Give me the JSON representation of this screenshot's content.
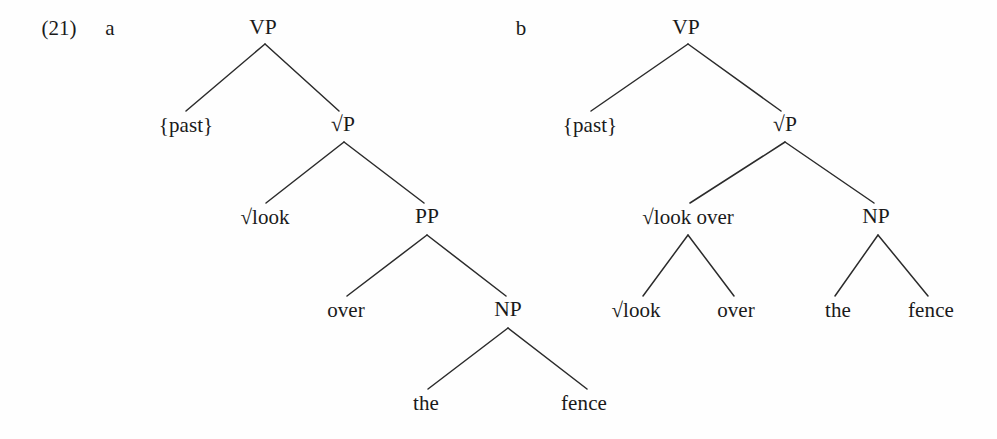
{
  "example": {
    "number": "(21)",
    "sub_labels": {
      "a": "a",
      "b": "b"
    }
  },
  "labels": {
    "vp": "VP",
    "root_p": "√P",
    "pp": "PP",
    "np": "NP",
    "past": "{past}",
    "root_look": "√look",
    "root_look_over": "√look over",
    "over": "over",
    "the": "the",
    "fence": "fence"
  },
  "tree_a": {
    "caption": "a",
    "root": {
      "label": "VP",
      "children": [
        {
          "label": "{past}"
        },
        {
          "label": "√P",
          "children": [
            {
              "label": "√look"
            },
            {
              "label": "PP",
              "children": [
                {
                  "label": "over"
                },
                {
                  "label": "NP",
                  "children": [
                    {
                      "label": "the"
                    },
                    {
                      "label": "fence"
                    }
                  ]
                }
              ]
            }
          ]
        }
      ]
    }
  },
  "tree_b": {
    "caption": "b",
    "root": {
      "label": "VP",
      "children": [
        {
          "label": "{past}"
        },
        {
          "label": "√P",
          "children": [
            {
              "label": "√look over",
              "children": [
                {
                  "label": "√look"
                },
                {
                  "label": "over"
                }
              ]
            },
            {
              "label": "NP",
              "children": [
                {
                  "label": "the"
                },
                {
                  "label": "fence"
                }
              ]
            }
          ]
        }
      ]
    }
  },
  "style": {
    "ink": "#1a1a1a",
    "branch_color": "#2b2b2b",
    "background": "#ffffff"
  },
  "geometry": {
    "tree_a": {
      "vp": {
        "x": 263,
        "y": 28
      },
      "past": {
        "x": 186,
        "y": 125
      },
      "root_p": {
        "x": 343,
        "y": 125
      },
      "root_look": {
        "x": 265,
        "y": 217
      },
      "pp": {
        "x": 427,
        "y": 217
      },
      "over": {
        "x": 346,
        "y": 310
      },
      "np": {
        "x": 508,
        "y": 310
      },
      "the": {
        "x": 426,
        "y": 403
      },
      "fence": {
        "x": 584,
        "y": 403
      }
    },
    "tree_b": {
      "vp": {
        "x": 686,
        "y": 28
      },
      "past": {
        "x": 590,
        "y": 125
      },
      "root_p": {
        "x": 785,
        "y": 125
      },
      "root_look_over": {
        "x": 688,
        "y": 217
      },
      "np": {
        "x": 876,
        "y": 217
      },
      "root_look": {
        "x": 636,
        "y": 310
      },
      "over": {
        "x": 736,
        "y": 310
      },
      "the": {
        "x": 838,
        "y": 310
      },
      "fence": {
        "x": 931,
        "y": 310
      }
    },
    "enum": {
      "number": {
        "x": 59,
        "y": 28
      },
      "a": {
        "x": 110,
        "y": 28
      },
      "b": {
        "x": 521,
        "y": 28
      }
    }
  }
}
